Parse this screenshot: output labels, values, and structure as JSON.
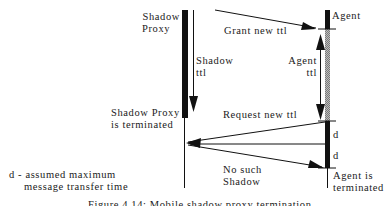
{
  "diagram": {
    "lifelines": {
      "shadow_proxy": {
        "label_line1": "Shadow",
        "label_line2": "Proxy"
      },
      "agent": {
        "label": "Agent"
      }
    },
    "durations": {
      "shadow_ttl": {
        "line1": "Shadow",
        "line2": "ttl"
      },
      "agent_ttl": {
        "line1": "Agent",
        "line2": "ttl"
      },
      "d_upper": "d",
      "d_lower": "d"
    },
    "messages": {
      "grant": "Grant new ttl",
      "request": "Request new ttl",
      "no_such_line1": "No such",
      "no_such_line2": "Shadow"
    },
    "events": {
      "shadow_terminated_line1": "Shadow Proxy",
      "shadow_terminated_line2": "is terminated",
      "agent_terminated_line1": "Agent is",
      "agent_terminated_line2": "terminated"
    },
    "legend": {
      "line1": "d - assumed maximum",
      "line2": "message transfer time"
    },
    "caption": "Figure 4.14: Mobile shadow proxy termination"
  }
}
